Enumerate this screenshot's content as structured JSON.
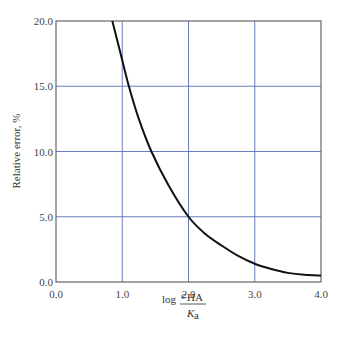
{
  "chart_data": {
    "type": "line",
    "title": "",
    "xlabel": "log (c_HA / K_a)",
    "xlabel_parts": {
      "prefix": "log",
      "numerator": "c",
      "numerator_sub": "HA",
      "denominator": "K",
      "denominator_sub": "a"
    },
    "ylabel": "Relative error, %",
    "xlim": [
      0.0,
      4.0
    ],
    "ylim": [
      0.0,
      20.0
    ],
    "x_ticks": [
      "0.0",
      "1.0",
      "2.0",
      "3.0",
      "4.0"
    ],
    "y_ticks": [
      "0.0",
      "5.0",
      "10.0",
      "15.0",
      "20.0"
    ],
    "grid": true,
    "grid_color": "#5a6fb8",
    "line_color": "#111111",
    "series": [
      {
        "name": "Relative error",
        "x": [
          0.85,
          1.0,
          1.1,
          1.25,
          1.44,
          1.7,
          2.0,
          2.25,
          2.5,
          2.75,
          3.0,
          3.25,
          3.5,
          3.75,
          4.0
        ],
        "y": [
          20.0,
          17.0,
          15.0,
          12.5,
          10.0,
          7.4,
          5.0,
          3.7,
          2.8,
          2.0,
          1.4,
          1.0,
          0.7,
          0.55,
          0.5
        ]
      }
    ],
    "legend": null
  }
}
